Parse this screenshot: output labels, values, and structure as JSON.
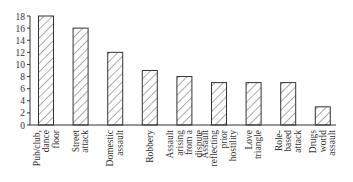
{
  "chart_data": {
    "type": "bar",
    "title": "",
    "xlabel": "",
    "ylabel": "",
    "ylim": [
      0,
      18
    ],
    "yticks": [
      0,
      2,
      4,
      6,
      8,
      10,
      12,
      14,
      16,
      18
    ],
    "grid": false,
    "legend": null,
    "bar_style": "diagonal-hatch",
    "categories": [
      [
        "Pub/club,",
        "dance",
        "floor"
      ],
      [
        "Street",
        "attack"
      ],
      [
        "Domestic",
        "assault"
      ],
      [
        "Robbery"
      ],
      [
        "Assault",
        "arising",
        "from a",
        "dispute"
      ],
      [
        "Assault",
        "reflecting",
        "prior",
        "hostility"
      ],
      [
        "Love",
        "triangle"
      ],
      [
        "Role-",
        "based",
        "attack"
      ],
      [
        "Drugs",
        "world",
        "assault"
      ]
    ],
    "category_names": [
      "Pub/club, dance floor",
      "Street attack",
      "Domestic assault",
      "Robbery",
      "Assault arising from a dispute",
      "Assault reflecting prior hostility",
      "Love triangle",
      "Role-based attack",
      "Drugs world assault"
    ],
    "values": [
      18,
      16,
      12,
      9,
      8,
      7,
      7,
      7,
      3
    ]
  }
}
